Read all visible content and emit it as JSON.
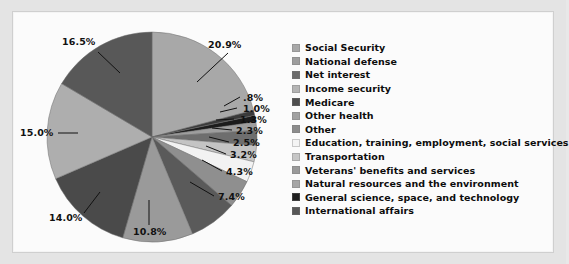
{
  "chart_data": {
    "type": "pie",
    "title": "",
    "subtitle": "",
    "xlabel": "",
    "ylabel": "",
    "legend_position": "right",
    "grid": false,
    "start_angle_deg": 0,
    "direction": "clockwise",
    "categories": [
      "Social Security",
      "National defense",
      "Net interest",
      "Income security",
      "Medicare",
      "Other health",
      "Other",
      "Education, training, employment, social services",
      "Transportation",
      "Veterans' benefits and services",
      "Natural resources and the environment",
      "General science, space, and technology",
      "International affairs"
    ],
    "values": [
      20.9,
      16.5,
      15.0,
      14.0,
      10.8,
      7.4,
      4.3,
      3.2,
      2.5,
      2.3,
      1.3,
      1.0,
      0.8
    ],
    "value_labels": [
      "20.9%",
      "16.5%",
      "15.0%",
      "14.0%",
      "10.8%",
      "7.4%",
      "4.3%",
      "3.2%",
      "2.5%",
      "2.3%",
      "1.3%",
      "1.0%",
      ".8%"
    ],
    "colors": [
      "#a8a8a8",
      "#b0b0b0",
      "#585858",
      "#aeaeae",
      "#4a4a4a",
      "#9a9a9a",
      "#8f8f8f",
      "#f2f2f2",
      "#c4c4c4",
      "#a3a3a3",
      "#9e9e9e",
      "#1c1c1c",
      "#3a3a3a"
    ],
    "slices": [
      {
        "label": "Social Security",
        "value": 20.9,
        "value_label": "20.9%",
        "color": "#a8a8a8"
      },
      {
        "label": "International affairs",
        "value": 0.8,
        "value_label": ".8%",
        "color": "#3a3a3a"
      },
      {
        "label": "General science, space, and technology",
        "value": 1.0,
        "value_label": "1.0%",
        "color": "#1c1c1c"
      },
      {
        "label": "Natural resources and the environment",
        "value": 1.3,
        "value_label": "1.3%",
        "color": "#9e9e9e"
      },
      {
        "label": "Veterans' benefits and services",
        "value": 2.3,
        "value_label": "2.3%",
        "color": "#6e6e6e"
      },
      {
        "label": "Transportation",
        "value": 2.5,
        "value_label": "2.5%",
        "color": "#c4c4c4"
      },
      {
        "label": "Education, training, employment, social services",
        "value": 3.2,
        "value_label": "3.2%",
        "color": "#f2f2f2"
      },
      {
        "label": "Other",
        "value": 4.3,
        "value_label": "4.3%",
        "color": "#8f8f8f"
      },
      {
        "label": "Other health",
        "value": 7.4,
        "value_label": "7.4%",
        "color": "#5a5a5a"
      },
      {
        "label": "Medicare",
        "value": 10.8,
        "value_label": "10.8%",
        "color": "#9a9a9a"
      },
      {
        "label": "Income security",
        "value": 14.0,
        "value_label": "14.0%",
        "color": "#4a4a4a"
      },
      {
        "label": "Net interest",
        "value": 15.0,
        "value_label": "15.0%",
        "color": "#aeaeae"
      },
      {
        "label": "National defense",
        "value": 16.5,
        "value_label": "16.5%",
        "color": "#585858"
      }
    ]
  },
  "pie": {
    "labels": {
      "social_security": "20.9%",
      "international_affairs": ".8%",
      "general_science": "1.0%",
      "natural_resources": "1.3%",
      "veterans": "2.3%",
      "transportation": "2.5%",
      "education": "3.2%",
      "other": "4.3%",
      "other_health": "7.4%",
      "medicare": "10.8%",
      "income_security": "14.0%",
      "net_interest": "15.0%",
      "national_defense": "16.5%"
    }
  },
  "legend": {
    "items": [
      {
        "label": "Social Security",
        "color": "#a8a8a8"
      },
      {
        "label": "National defense",
        "color": "#9d9d9d"
      },
      {
        "label": "Net interest",
        "color": "#6b6b6b"
      },
      {
        "label": "Income security",
        "color": "#b4b4b4"
      },
      {
        "label": "Medicare",
        "color": "#4e4e4e"
      },
      {
        "label": "Other health",
        "color": "#a0a0a0"
      },
      {
        "label": "Other",
        "color": "#8c8c8c"
      },
      {
        "label": "Education, training, employment, social services",
        "color": "#f4f4f4"
      },
      {
        "label": "Transportation",
        "color": "#c6c6c6"
      },
      {
        "label": "Veterans' benefits and services",
        "color": "#9a9a9a"
      },
      {
        "label": "Natural resources and the environment",
        "color": "#a5a5a5"
      },
      {
        "label": "General science, space, and technology",
        "color": "#1f1f1f"
      },
      {
        "label": "International affairs",
        "color": "#575757"
      }
    ]
  },
  "theme": {
    "panel_bg": "#fbfbfb",
    "frame_bg": "#e4e4e4",
    "text": "#0d0d0d"
  }
}
